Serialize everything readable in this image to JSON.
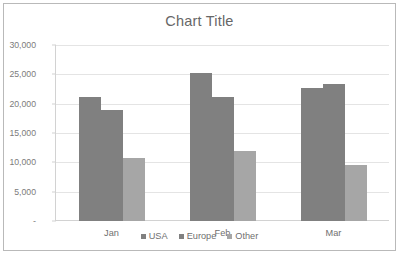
{
  "chart_data": {
    "type": "bar",
    "title": "Chart Title",
    "xlabel": "",
    "ylabel": "",
    "categories": [
      "Jan",
      "Feb",
      "Mar"
    ],
    "series": [
      {
        "name": "USA",
        "color": "#808080",
        "values": [
          21200,
          25300,
          22700
        ]
      },
      {
        "name": "Europe",
        "color": "#808080",
        "values": [
          19000,
          21200,
          23400
        ]
      },
      {
        "name": "Other",
        "color": "#a6a6a6",
        "values": [
          10700,
          12000,
          9500
        ]
      }
    ],
    "ylim": [
      0,
      30000
    ],
    "ytick_values": [
      0,
      5000,
      10000,
      15000,
      20000,
      25000,
      30000
    ],
    "ytick_labels": [
      "-",
      "5,000",
      "10,000",
      "15,000",
      "20,000",
      "25,000",
      "30,000"
    ],
    "grid": "horizontal",
    "legend_position": "bottom",
    "gridline_color": "#e4e4e4",
    "axis_color": "#d2d2d2",
    "plot_background": "#ffffff",
    "border_color": "#b9b9b9"
  }
}
